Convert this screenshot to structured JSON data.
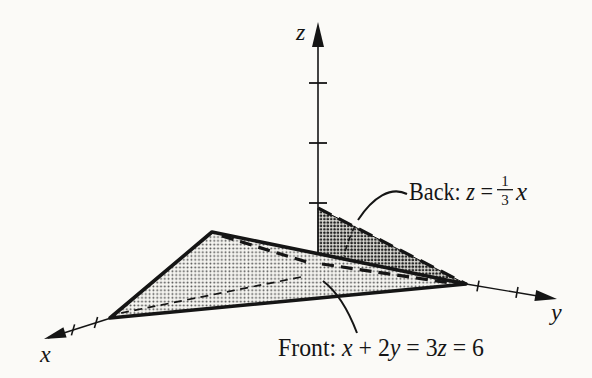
{
  "page": {
    "background": "#fbfaf7",
    "ink": "#151515"
  },
  "axes": {
    "x_label": "x",
    "y_label": "y",
    "z_label": "z"
  },
  "annotations": {
    "back": {
      "prefix": "Back: ",
      "var_z": "z",
      "equals": " =",
      "frac_numerator": "1",
      "frac_denominator": "3",
      "var_x": "x",
      "equation": "z = (1/3)x"
    },
    "front": {
      "parts": [
        {
          "t": "Front: "
        },
        {
          "t": "x",
          "italic": true
        },
        {
          "t": " + 2"
        },
        {
          "t": "y",
          "italic": true
        },
        {
          "t": " = 3"
        },
        {
          "t": "z",
          "italic": true
        },
        {
          "t": " = 6"
        }
      ],
      "equation": "x + 2y = 3z = 6"
    }
  }
}
